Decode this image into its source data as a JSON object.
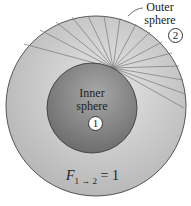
{
  "diagram": {
    "outer_label": "Outer\nsphere",
    "outer_label_line1": "Outer",
    "outer_label_line2": "sphere",
    "outer_number": "2",
    "inner_label_line1": "Inner",
    "inner_label_line2": "sphere",
    "inner_number": "1",
    "formula_main": "F",
    "formula_sub": "1 → 2",
    "formula_rhs": " = 1",
    "colors": {
      "outer_fill": "#c4c4c4",
      "inner_fill": "#8a8a8a",
      "ray": "#7a7a7a",
      "outline": "#333333"
    }
  }
}
